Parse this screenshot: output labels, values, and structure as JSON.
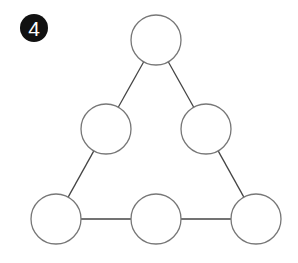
{
  "badge": {
    "number": "4",
    "x": 20,
    "y": 14,
    "color": "#111111"
  },
  "diagram": {
    "stroke": "#444444",
    "circle_stroke": "#777777",
    "radius": 25,
    "nodes": [
      {
        "id": "top",
        "cx": 156,
        "cy": 40
      },
      {
        "id": "mid-left",
        "cx": 106,
        "cy": 129
      },
      {
        "id": "mid-right",
        "cx": 206,
        "cy": 129
      },
      {
        "id": "bottom-left",
        "cx": 56,
        "cy": 219
      },
      {
        "id": "bottom-middle",
        "cx": 156,
        "cy": 219
      },
      {
        "id": "bottom-right",
        "cx": 256,
        "cy": 219
      }
    ],
    "edges": [
      [
        "top",
        "mid-left"
      ],
      [
        "mid-left",
        "bottom-left"
      ],
      [
        "top",
        "mid-right"
      ],
      [
        "mid-right",
        "bottom-right"
      ],
      [
        "bottom-left",
        "bottom-middle"
      ],
      [
        "bottom-middle",
        "bottom-right"
      ]
    ]
  }
}
